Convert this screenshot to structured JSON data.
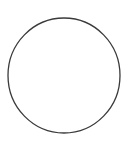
{
  "canvas": {
    "width": 131,
    "height": 150,
    "background_color": "#ffffff",
    "description": "Plain white canvas containing a single unfilled circle outline"
  },
  "figure": {
    "name": "circle-outline",
    "shape_type": "circle",
    "label": "",
    "fill": "none",
    "stroke_color": "#3a3a3c",
    "stroke_width": 1.3,
    "center_x": 64,
    "center_y": 75.5,
    "radius_x": 56,
    "radius_y": 57.5,
    "bounds": {
      "left": 8,
      "top": 18,
      "right": 120,
      "bottom": 133
    }
  },
  "text_content": {
    "title": "",
    "caption": "",
    "labels": []
  }
}
